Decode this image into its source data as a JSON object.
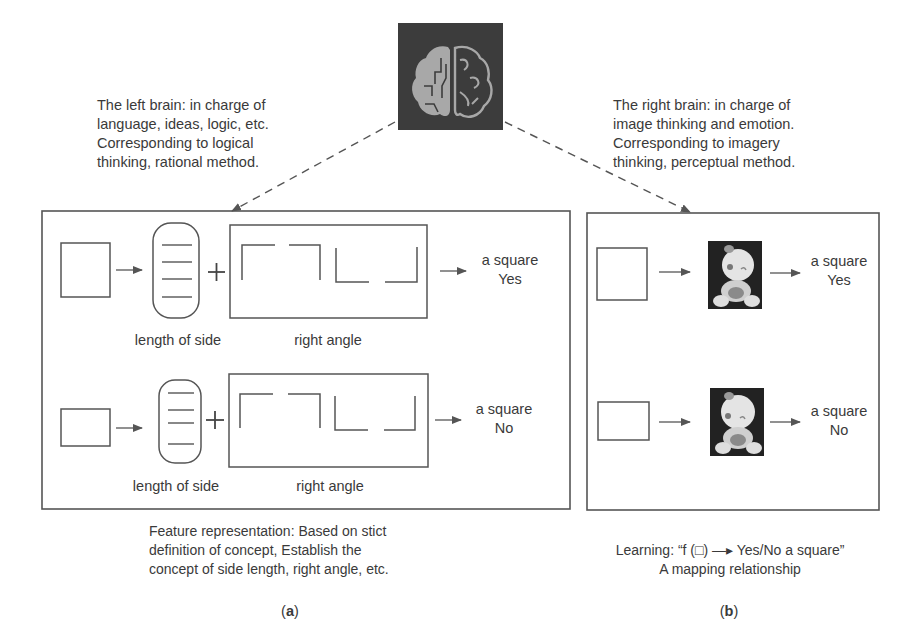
{
  "brain_icon": {
    "name": "brain-circuit-icon",
    "bg": "#3c3c3c",
    "fg": "#a8a8a8"
  },
  "left_brain_caption": [
    "The left brain: in charge of",
    "language, ideas, logic, etc.",
    "Corresponding to logical",
    "thinking, rational method."
  ],
  "right_brain_caption": [
    "The right brain: in charge of",
    "image thinking and emotion.",
    "Corresponding to imagery",
    "thinking, perceptual method."
  ],
  "panel_a": {
    "rows": [
      {
        "side_label": "length of side",
        "angle_label": "right angle",
        "result_line1": "a square",
        "result_line2": "Yes",
        "plus": "+"
      },
      {
        "side_label": "length of side",
        "angle_label": "right angle",
        "result_line1": "a square",
        "result_line2": "No",
        "plus": "+"
      }
    ],
    "caption": [
      "Feature representation: Based on stict",
      "definition of concept, Establish the",
      "concept of side length, right angle, etc."
    ],
    "label": "a"
  },
  "panel_b": {
    "rows": [
      {
        "result_line1": "a square",
        "result_line2": "Yes"
      },
      {
        "result_line1": "a square",
        "result_line2": "No"
      }
    ],
    "caption": [
      "Learning: “f (□) —▸ Yes/No a square”",
      "A mapping relationship"
    ],
    "label": "b"
  },
  "colors": {
    "line": "#555555",
    "text": "#3a3a3a",
    "dark": "#2a2a2a"
  }
}
